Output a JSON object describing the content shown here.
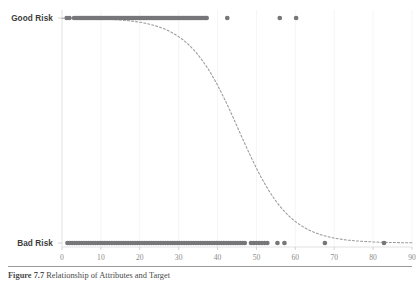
{
  "figure": {
    "caption_label": "Figure 7.7",
    "caption_text": "Relationship of Attributes and Target",
    "caption_full": "Figure 7.7   Relationship of Attributes and Target"
  },
  "axes": {
    "y_categories": [
      "Good Risk",
      "Bad Risk"
    ],
    "x_ticks": [
      0,
      10,
      20,
      30,
      40,
      50,
      60,
      70,
      80,
      90
    ],
    "x_min": 0,
    "x_max": 90,
    "grid": true,
    "grid_color": "#f2f2f2",
    "axis_color": "#d9d9d9",
    "tick_label_color": "#8a8a8a",
    "y_label_color": "#3b3b3b"
  },
  "style": {
    "point_color": "#77777a",
    "curve_color": "#9a9a9a",
    "background": "#ffffff",
    "point_radius": 2.35,
    "curve_dash": "2,2.1"
  },
  "chart_data": {
    "type": "scatter",
    "title": "",
    "subtitle": "",
    "xlabel": "",
    "ylabel": "",
    "xlim": [
      0,
      90
    ],
    "ylim": [
      0,
      1
    ],
    "grid": true,
    "legend": "none",
    "y_tick_labels": [
      "Good Risk",
      "Bad Risk"
    ],
    "y_tick_values": [
      1,
      0
    ],
    "x_tick_labels": [
      "0",
      "10",
      "20",
      "30",
      "40",
      "50",
      "60",
      "70",
      "80",
      "90"
    ],
    "x_tick_values": [
      0,
      10,
      20,
      30,
      40,
      50,
      60,
      70,
      80,
      90
    ],
    "series": [
      {
        "name": "Good Risk",
        "y": 1,
        "x": [
          1.2,
          1.9,
          3.1,
          3.6,
          4.0,
          4.5,
          4.9,
          5.3,
          5.7,
          6.1,
          6.5,
          6.9,
          7.3,
          7.7,
          8.1,
          8.5,
          8.9,
          9.3,
          9.7,
          10.1,
          10.5,
          10.9,
          11.3,
          11.7,
          12.1,
          12.5,
          12.9,
          13.3,
          13.7,
          14.1,
          14.5,
          14.9,
          15.3,
          15.7,
          16.1,
          16.5,
          16.9,
          17.3,
          17.7,
          18.1,
          18.5,
          18.9,
          19.3,
          19.7,
          20.1,
          20.5,
          20.9,
          21.3,
          21.7,
          22.1,
          22.5,
          22.9,
          23.3,
          23.7,
          24.1,
          24.5,
          24.9,
          25.3,
          25.7,
          26.1,
          26.5,
          26.9,
          27.3,
          27.7,
          28.1,
          28.5,
          28.9,
          29.3,
          29.7,
          30.1,
          30.5,
          30.9,
          31.3,
          31.7,
          32.1,
          32.5,
          32.9,
          33.3,
          33.7,
          34.1,
          34.5,
          34.9,
          35.3,
          35.7,
          36.1,
          36.5,
          36.9,
          37.2,
          42.5,
          56.0,
          60.2
        ]
      },
      {
        "name": "Bad Risk",
        "y": 0,
        "x": [
          1.4,
          2.0,
          2.6,
          3.2,
          3.8,
          4.4,
          5.0,
          5.6,
          6.2,
          6.8,
          7.4,
          8.0,
          8.6,
          9.2,
          9.8,
          10.4,
          11.0,
          11.6,
          12.2,
          12.8,
          13.4,
          14.0,
          14.6,
          15.2,
          15.8,
          16.4,
          17.0,
          17.6,
          18.2,
          18.8,
          19.4,
          20.0,
          20.6,
          21.2,
          21.8,
          22.4,
          23.0,
          23.6,
          24.2,
          24.8,
          25.4,
          26.0,
          26.6,
          27.2,
          27.8,
          28.4,
          29.0,
          29.6,
          30.2,
          30.8,
          31.4,
          32.0,
          32.6,
          33.2,
          33.8,
          34.4,
          35.0,
          35.6,
          36.2,
          36.8,
          37.4,
          38.0,
          38.6,
          39.2,
          39.8,
          40.4,
          41.0,
          41.6,
          42.2,
          42.8,
          43.4,
          44.0,
          44.6,
          45.2,
          45.8,
          46.4,
          47.0,
          48.6,
          49.3,
          50.0,
          50.7,
          51.4,
          52.1,
          52.8,
          55.4,
          57.2,
          67.6,
          82.8
        ]
      }
    ],
    "fit_curve": {
      "name": "Logistic fit",
      "style": "dashed",
      "x0": 45.5,
      "k": 0.155,
      "points": [
        [
          1.0,
          0.995
        ],
        [
          5.0,
          0.99
        ],
        [
          10.0,
          0.981
        ],
        [
          15.0,
          0.964
        ],
        [
          20.0,
          0.93
        ],
        [
          25.0,
          0.87
        ],
        [
          30.0,
          0.775
        ],
        [
          35.0,
          0.64
        ],
        [
          40.0,
          0.478
        ],
        [
          45.0,
          0.32
        ],
        [
          50.0,
          0.2
        ],
        [
          55.0,
          0.12
        ],
        [
          60.0,
          0.072
        ],
        [
          65.0,
          0.044
        ],
        [
          70.0,
          0.028
        ],
        [
          75.0,
          0.018
        ],
        [
          80.0,
          0.012
        ],
        [
          85.0,
          0.008
        ],
        [
          88.0,
          0.006
        ]
      ]
    }
  }
}
